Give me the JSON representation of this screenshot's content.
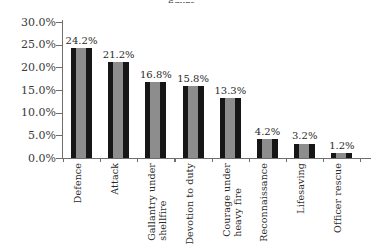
{
  "chart_data": {
    "type": "bar",
    "title": "",
    "xlabel": "",
    "ylabel": "",
    "ylim": [
      0,
      30
    ],
    "ytick_step": 5,
    "ytick_labels": [
      "30.0%",
      "25.0%",
      "20.0%",
      "15.0%",
      "10.0%",
      "5.0%",
      "0.0%"
    ],
    "ytick_values": [
      30,
      25,
      20,
      15,
      10,
      5,
      0
    ],
    "grid": false,
    "legend": null,
    "value_label_suffix": "%",
    "categories": [
      "Defence",
      "Attack",
      "Gallantry under shellfire",
      "Devotion to duty",
      "Courage under heavy fire",
      "Reconnaissance",
      "Lifesaving",
      "Officer rescue"
    ],
    "category_label_lines": [
      "Defence",
      "Attack",
      "Gallantry under\nshellfire",
      "Devotion to duty",
      "Courage under\nheavy fire",
      "Reconnaissance",
      "Lifesaving",
      "Officer rescue"
    ],
    "values": [
      24.2,
      21.2,
      16.8,
      15.8,
      13.3,
      4.2,
      3.2,
      1.2
    ],
    "value_labels": [
      "24.2%",
      "21.2%",
      "16.8%",
      "15.8%",
      "13.3%",
      "4.2%",
      "3.2%",
      "1.2%"
    ]
  },
  "style": {
    "bar_dark": "#161616",
    "bar_light": "#8d8d8d",
    "axis_color": "#6e6e6e",
    "text_color": "#2b2b2b",
    "background": "#ffffff"
  },
  "title_fragment": "figure"
}
